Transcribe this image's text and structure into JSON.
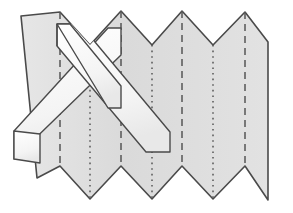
{
  "figure": {
    "canvas": {
      "width": 293,
      "height": 213
    },
    "colors": {
      "background": "#ffffff",
      "paper_fill": "#d9d9d9",
      "paper_fill_light": "#e4e4e4",
      "strip_fill": "#fbfbfb",
      "strip_fill_shadow": "#ececec",
      "outline": "#4a4a4a",
      "fold_line": "#555555"
    },
    "stroke_widths": {
      "outline": 1.6,
      "strip_outline": 1.4,
      "fold_line": 1.5
    }
  },
  "paper": {
    "name": "accordion-sheet",
    "panel_count": 8,
    "left_edge_top_x": 21,
    "left_edge_top_y": 16,
    "left_edge_bottom_x": 37,
    "left_edge_bottom_y": 178,
    "right_edge_x": 268,
    "right_edge_top_y": 42,
    "right_edge_bottom_y": 200,
    "outline_points": "21,16 60,12 90,45 121,11 152,45 182,11 213,45 245,12 268,42 268,200 245,166 213,199 182,166 152,199 121,166 90,199 60,166 37,178",
    "top_peaks_x": [
      60,
      121,
      182,
      245
    ],
    "top_valleys_x": [
      90,
      152,
      213
    ],
    "bottom_valleys_x": [
      90,
      152,
      213
    ],
    "bottom_peaks_x": [
      60,
      121,
      182,
      245
    ]
  },
  "fold_lines": {
    "mountain_label": "mountain-fold",
    "valley_label": "valley-fold",
    "mountain_dash_pattern": "7 5",
    "valley_dash_pattern": "1.6 4",
    "mountain": [
      {
        "x": 60,
        "y1": 12,
        "y2": 166
      },
      {
        "x": 121,
        "y1": 11,
        "y2": 166
      },
      {
        "x": 182,
        "y1": 11,
        "y2": 166
      },
      {
        "x": 245,
        "y1": 12,
        "y2": 166
      }
    ],
    "valley": [
      {
        "x": 90,
        "y1": 45,
        "y2": 199
      },
      {
        "x": 152,
        "y1": 45,
        "y2": 199
      },
      {
        "x": 213,
        "y1": 45,
        "y2": 199
      }
    ]
  },
  "strip": {
    "name": "woven-paper-strip",
    "descending_band": {
      "label": "descending-strip-segment",
      "points": "62,25 90,22 166,122 166,145 136,147 54,45"
    },
    "ascending_band": {
      "label": "ascending-strip-segment",
      "points": "16,156 16,133 102,57 121,57 121,75 40,160"
    },
    "tail_left": {
      "label": "strip-left-tail",
      "points": "16,133 16,156 40,160 40,136"
    },
    "wide_band_main": {
      "label": "strip-main-diagonal",
      "points": "62,25 82,25 166,129 166,147 147,147 62,43"
    },
    "lower_band": {
      "label": "strip-lower-diagonal",
      "points": "16,133 16,158 116,73 116,50"
    },
    "notch": {
      "label": "strip-fold-notch",
      "points": "62,25 82,25 82,45 62,45"
    }
  },
  "annotations": {
    "figure_kind": "diagram",
    "subject": "origami pleat with interlaced band"
  }
}
